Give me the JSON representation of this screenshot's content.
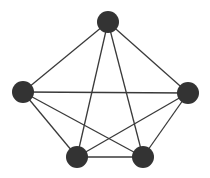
{
  "diagram": {
    "type": "graph",
    "colors": {
      "node": "#333333",
      "edge": "#3a3a3a",
      "background": "#ffffff"
    },
    "nodes": [
      {
        "id": "top"
      },
      {
        "id": "left"
      },
      {
        "id": "right"
      },
      {
        "id": "bottom-left"
      },
      {
        "id": "bottom-right"
      }
    ],
    "edges": [
      [
        "top",
        "left"
      ],
      [
        "top",
        "right"
      ],
      [
        "top",
        "bottom-left"
      ],
      [
        "top",
        "bottom-right"
      ],
      [
        "left",
        "right"
      ],
      [
        "left",
        "bottom-left"
      ],
      [
        "left",
        "bottom-right"
      ],
      [
        "right",
        "bottom-left"
      ],
      [
        "right",
        "bottom-right"
      ],
      [
        "bottom-left",
        "bottom-right"
      ]
    ]
  }
}
